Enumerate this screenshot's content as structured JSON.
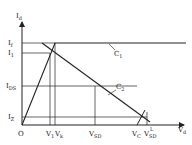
{
  "diagram": {
    "axes": {
      "y_label": "I",
      "y_label_sub": "d",
      "x_label": "V",
      "x_label_sub": "d",
      "origin_label": "O"
    },
    "y_ticks": [
      {
        "label": "I",
        "sub": "f"
      },
      {
        "label": "I",
        "sub": "1"
      },
      {
        "label": "I",
        "sub": "DS"
      },
      {
        "label": "I",
        "sub": "Z"
      }
    ],
    "x_ticks": [
      {
        "label": "V",
        "sub": "1"
      },
      {
        "label": "V",
        "sub": "k"
      },
      {
        "label": "V",
        "sub": "SD"
      },
      {
        "label": "V",
        "sub": "C"
      },
      {
        "label": "V",
        "sub": "SD",
        "sup": "L"
      }
    ],
    "curves": [
      {
        "label": "C",
        "sub": "1"
      },
      {
        "label": "C",
        "sub": "2"
      }
    ]
  }
}
